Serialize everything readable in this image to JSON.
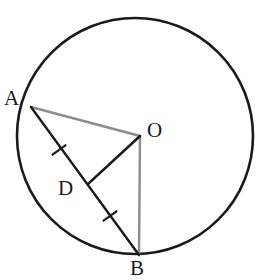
{
  "figure": {
    "background_color": "#ffffff",
    "width": 260,
    "height": 280
  },
  "circle": {
    "name": "circle-outline",
    "center_x": 135,
    "center_y": 136,
    "radius": 118,
    "stroke_color": "#1a1a1a",
    "stroke_width": 2.6,
    "fill": "none"
  },
  "points": [
    {
      "id": "A",
      "label": "A",
      "x": 31,
      "y": 107,
      "on_circle": true,
      "label_x": 4,
      "label_y": 88
    },
    {
      "id": "O",
      "label": "O",
      "x": 140,
      "y": 136,
      "on_circle": false,
      "label_x": 147,
      "label_y": 120
    },
    {
      "id": "B",
      "label": "B",
      "x": 139,
      "y": 255,
      "on_circle": true,
      "label_x": 130,
      "label_y": 258
    },
    {
      "id": "D",
      "label": "D",
      "x": 88,
      "y": 184,
      "on_circle": false,
      "label_x": 58,
      "label_y": 178
    }
  ],
  "segments": [
    {
      "id": "AO",
      "from": "A",
      "to": "O",
      "x1": 31,
      "y1": 107,
      "x2": 140,
      "y2": 136,
      "color": "#8c8c8c",
      "width": 2.4,
      "style": "radius"
    },
    {
      "id": "OB",
      "from": "O",
      "to": "B",
      "x1": 140,
      "y1": 136,
      "x2": 139,
      "y2": 255,
      "color": "#8c8c8c",
      "width": 2.4,
      "style": "radius"
    },
    {
      "id": "AB",
      "from": "A",
      "to": "B",
      "x1": 31,
      "y1": 107,
      "x2": 139,
      "y2": 255,
      "color": "#1a1a1a",
      "width": 2.4,
      "style": "chord"
    },
    {
      "id": "OD",
      "from": "O",
      "to": "D",
      "x1": 140,
      "y1": 136,
      "x2": 88,
      "y2": 184,
      "color": "#1a1a1a",
      "width": 2.4,
      "style": "perpendicular"
    }
  ],
  "tick_marks": [
    {
      "id": "tick-AD",
      "on_segment": "AD",
      "x": 59,
      "y": 150,
      "count": 1,
      "color": "#1a1a1a",
      "width": 2.2,
      "length": 16
    },
    {
      "id": "tick-DB",
      "on_segment": "DB",
      "x": 110,
      "y": 216,
      "count": 1,
      "color": "#1a1a1a",
      "width": 2.2,
      "length": 16
    }
  ],
  "labels": {
    "A": "A",
    "O": "O",
    "B": "B",
    "D": "D"
  },
  "colors": {
    "stroke_dark": "#1a1a1a",
    "stroke_gray": "#8c8c8c",
    "background": "#ffffff"
  }
}
